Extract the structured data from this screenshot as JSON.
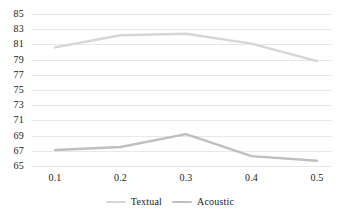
{
  "chart_data": {
    "type": "line",
    "title": "",
    "subtitle": "",
    "xlabel": "",
    "ylabel": "",
    "categories": [
      "0.1",
      "0.2",
      "0.3",
      "0.4",
      "0.5"
    ],
    "ylim": [
      65,
      85
    ],
    "y_ticks": [
      "85",
      "83",
      "81",
      "79",
      "77",
      "75",
      "73",
      "71",
      "69",
      "67",
      "65"
    ],
    "grid": true,
    "legend_position": "bottom-center",
    "series": [
      {
        "name": "Textual",
        "color": "#d6d6d6",
        "values": [
          80.6,
          82.2,
          82.4,
          81.1,
          78.8
        ]
      },
      {
        "name": "Acoustic",
        "color": "#bfbfbf",
        "values": [
          67.1,
          67.5,
          69.2,
          66.3,
          65.7
        ]
      }
    ]
  },
  "colors": {
    "gridline": "#e8e8e8",
    "background": "#ffffff",
    "text": "#1a1a1a"
  }
}
